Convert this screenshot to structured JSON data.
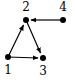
{
  "graph": {
    "type": "directed",
    "nodes": [
      {
        "id": "1",
        "label": "1",
        "x": 8,
        "y": 57,
        "lx": 8,
        "ly": 74
      },
      {
        "id": "2",
        "label": "2",
        "x": 26,
        "y": 20,
        "lx": 26,
        "ly": 11
      },
      {
        "id": "3",
        "label": "3",
        "x": 43,
        "y": 58,
        "lx": 43,
        "ly": 75
      },
      {
        "id": "4",
        "label": "4",
        "x": 63,
        "y": 20,
        "lx": 63,
        "ly": 11
      }
    ],
    "edges": [
      {
        "from": "1",
        "to": "2"
      },
      {
        "from": "1",
        "to": "3"
      },
      {
        "from": "2",
        "to": "3"
      },
      {
        "from": "4",
        "to": "2"
      }
    ]
  },
  "colors": {
    "node": "#000000",
    "edge": "#000000"
  }
}
